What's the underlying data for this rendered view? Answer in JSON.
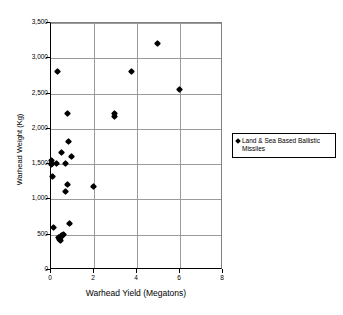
{
  "chart_data": {
    "type": "scatter",
    "title": "",
    "xlabel": "Warhead Yield (Megatons)",
    "ylabel": "Warhead Weight (Kg)",
    "xlim": [
      0,
      8
    ],
    "ylim": [
      0,
      3500
    ],
    "xticks": [
      0,
      2,
      4,
      6,
      8
    ],
    "xtick_labels": [
      "0",
      "2",
      "4",
      "6",
      "8"
    ],
    "yticks": [
      0,
      500,
      1000,
      1500,
      2000,
      2500,
      3000,
      3500
    ],
    "ytick_labels": [
      "0",
      "500",
      "1,000",
      "1,500",
      "2,000",
      "2,500",
      "3,000",
      "3,500"
    ],
    "grid": "horizontal-and-vertical",
    "legend_position": "right",
    "series": [
      {
        "name": "Land & Sea Based Ballistic Missiles",
        "marker": "diamond",
        "color": "#000000",
        "points": [
          [
            0.05,
            1540
          ],
          [
            0.05,
            1500
          ],
          [
            0.08,
            1480
          ],
          [
            0.1,
            1310
          ],
          [
            0.15,
            590
          ],
          [
            0.3,
            1490
          ],
          [
            0.35,
            2800
          ],
          [
            0.4,
            440
          ],
          [
            0.45,
            420
          ],
          [
            0.5,
            450
          ],
          [
            0.5,
            410
          ],
          [
            0.55,
            1650
          ],
          [
            0.55,
            480
          ],
          [
            0.6,
            470
          ],
          [
            0.65,
            490
          ],
          [
            0.7,
            1500
          ],
          [
            0.72,
            1100
          ],
          [
            0.8,
            2200
          ],
          [
            0.82,
            1200
          ],
          [
            0.85,
            1800
          ],
          [
            0.9,
            650
          ],
          [
            1.0,
            1600
          ],
          [
            2.0,
            1170
          ],
          [
            3.0,
            2200
          ],
          [
            3.0,
            2160
          ],
          [
            3.8,
            2800
          ],
          [
            5.0,
            3200
          ],
          [
            6.0,
            2550
          ]
        ]
      }
    ]
  },
  "legend": {
    "entries": [
      {
        "label": "Land & Sea Based Ballistic Missiles"
      }
    ]
  }
}
